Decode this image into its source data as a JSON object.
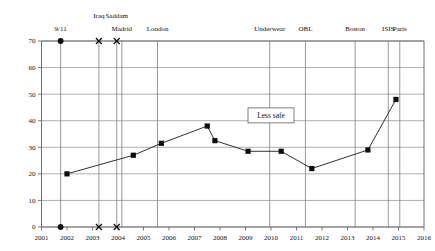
{
  "chart_data": {
    "type": "line",
    "title": "",
    "subtitle": "",
    "xlabel": "",
    "ylabel": "",
    "xlim": [
      2001,
      2016
    ],
    "ylim": [
      0,
      70
    ],
    "grid": true,
    "legend_position": "none",
    "x_ticks": [
      "2001",
      "2002",
      "2003",
      "2004",
      "2005",
      "2006",
      "2007",
      "2008",
      "2009",
      "2010",
      "2011",
      "2012",
      "2013",
      "2014",
      "2015",
      "2016"
    ],
    "y_ticks": [
      "0",
      "10",
      "20",
      "30",
      "40",
      "50",
      "60",
      "70"
    ],
    "series": [
      {
        "name": "Less safe",
        "x": [
          2002.0,
          2004.6,
          2005.7,
          2007.5,
          2007.8,
          2009.1,
          2010.4,
          2011.6,
          2013.8,
          2014.9
        ],
        "values": [
          20,
          27,
          31.5,
          38,
          32.5,
          28.5,
          28.5,
          22,
          29,
          48
        ]
      }
    ],
    "annotations": [
      {
        "text": "Less safe",
        "x": 2010.0,
        "y": 42
      }
    ],
    "event_markers": [
      {
        "label": "9/11",
        "x": 2001.75,
        "marker": "dot"
      },
      {
        "label": "Iraq",
        "x": 2003.25,
        "marker": "x"
      },
      {
        "label": "Saddam",
        "x": 2003.95,
        "marker": "x"
      },
      {
        "label": "Madrid",
        "x": 2004.15,
        "marker": "none"
      },
      {
        "label": "London",
        "x": 2005.55,
        "marker": "none"
      },
      {
        "label": "Underwear",
        "x": 2009.95,
        "marker": "none"
      },
      {
        "label": "OBL",
        "x": 2011.35,
        "marker": "none"
      },
      {
        "label": "Boston",
        "x": 2013.3,
        "marker": "none"
      },
      {
        "label": "ISIS",
        "x": 2014.6,
        "marker": "none"
      },
      {
        "label": "Paris",
        "x": 2015.05,
        "marker": "none"
      }
    ]
  }
}
